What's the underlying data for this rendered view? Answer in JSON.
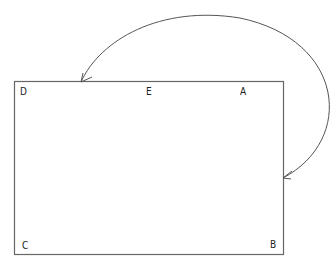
{
  "diagram": {
    "type": "rectangle-with-curved-arrow",
    "rectangle": {
      "x": 14,
      "y": 81,
      "width": 270,
      "height": 174
    },
    "labels": {
      "A": {
        "text": "A",
        "x": 240,
        "y": 94
      },
      "B": {
        "text": "B",
        "x": 240,
        "y": 248
      },
      "C": {
        "text": "C",
        "x": 22,
        "y": 248
      },
      "D": {
        "text": "D",
        "x": 20,
        "y": 94
      },
      "E": {
        "text": "E",
        "x": 145,
        "y": 94
      }
    },
    "arrow": {
      "description": "Curved double-headed arrow from right edge of rectangle (near A-B side) looping above to top edge near D",
      "start": {
        "x": 283,
        "y": 178
      },
      "end": {
        "x": 81,
        "y": 82
      },
      "stroke": "#555555"
    },
    "stroke_color": "#666666"
  }
}
